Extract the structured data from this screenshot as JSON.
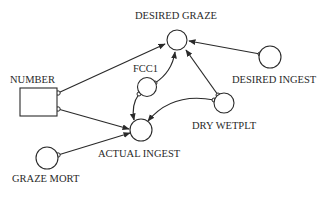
{
  "diagram": {
    "type": "stella-style system dynamics influence diagram",
    "colors": {
      "stroke": "#2a2a2a",
      "background": "#ffffff"
    },
    "nodes": {
      "number": {
        "label": "NUMBER",
        "shape": "stock-box"
      },
      "desired_graze": {
        "label": "DESIRED GRAZE",
        "shape": "converter-circle"
      },
      "fcc1": {
        "label": "FCC1",
        "shape": "converter-circle"
      },
      "desired_ingest": {
        "label": "DESIRED INGEST",
        "shape": "converter-circle"
      },
      "dry_wetplt": {
        "label": "DRY WETPLT",
        "shape": "converter-circle"
      },
      "actual_ingest": {
        "label": "ACTUAL INGEST",
        "shape": "converter-circle"
      },
      "graze_mort": {
        "label": "GRAZE MORT",
        "shape": "converter-circle"
      }
    },
    "links": [
      {
        "from": "NUMBER",
        "to": "DESIRED GRAZE"
      },
      {
        "from": "NUMBER",
        "to": "ACTUAL INGEST"
      },
      {
        "from": "FCC1",
        "to": "DESIRED GRAZE"
      },
      {
        "from": "FCC1",
        "to": "ACTUAL INGEST"
      },
      {
        "from": "DESIRED INGEST",
        "to": "DESIRED GRAZE"
      },
      {
        "from": "DRY WETPLT",
        "to": "DESIRED GRAZE"
      },
      {
        "from": "DRY WETPLT",
        "to": "ACTUAL INGEST"
      },
      {
        "from": "GRAZE MORT",
        "to": "ACTUAL INGEST"
      }
    ]
  }
}
